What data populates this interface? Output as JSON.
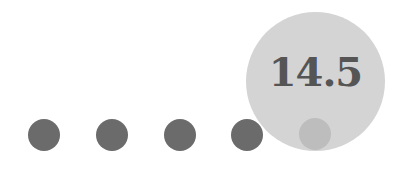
{
  "slider": {
    "value": "14.5",
    "steps": 5,
    "active_index": 4,
    "colors": {
      "dot": "#6b6b6b",
      "active_dot": "#bdbdbd",
      "bubble": "#d4d4d4",
      "text": "#555555"
    }
  }
}
